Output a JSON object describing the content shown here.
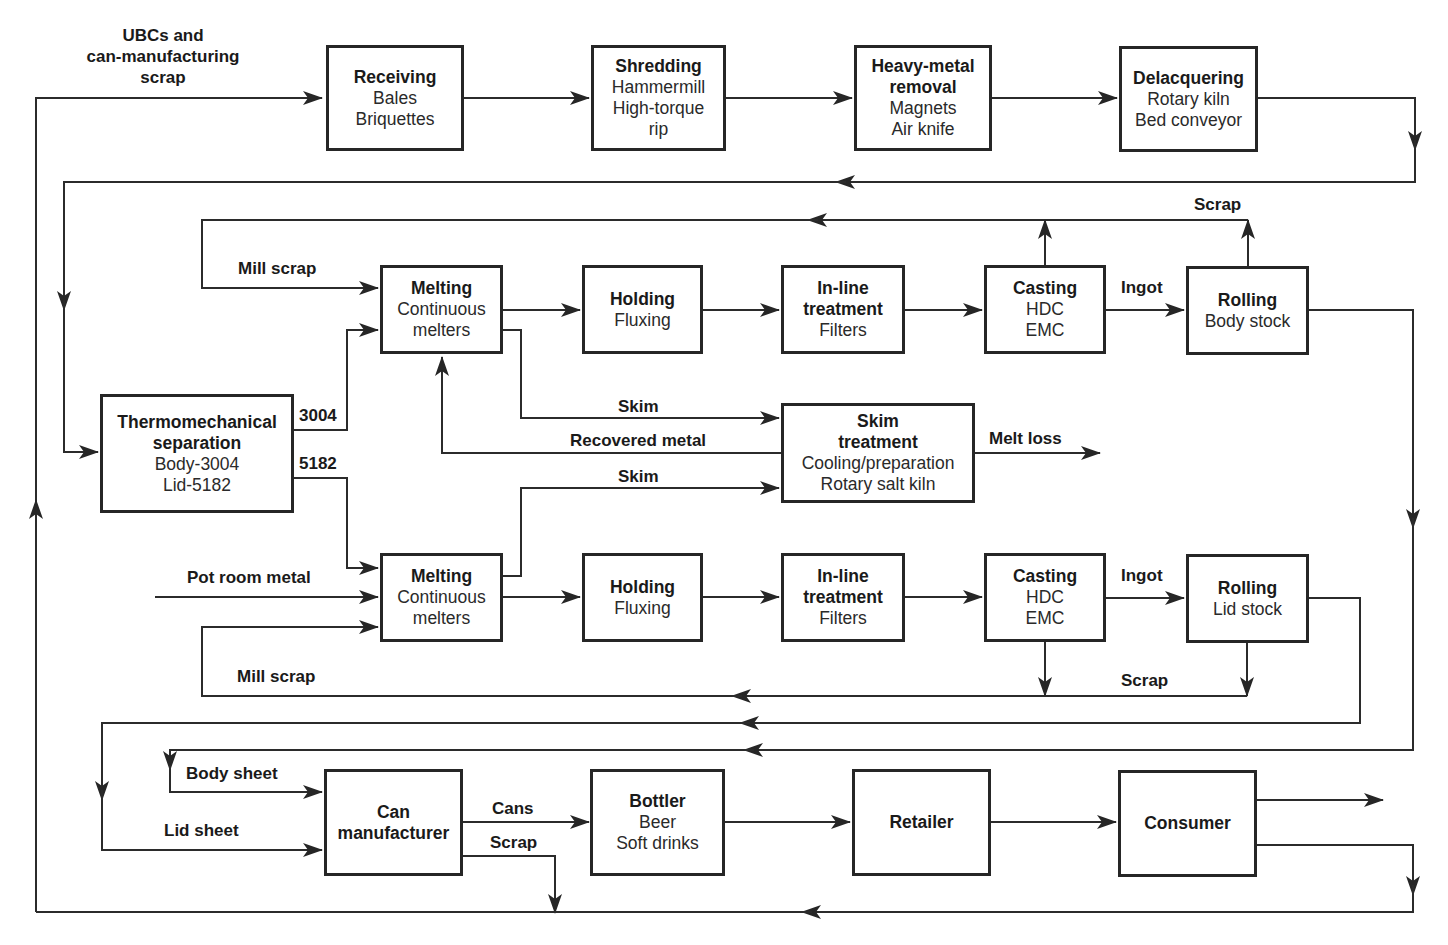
{
  "diagram": {
    "boxes": {
      "receiving": {
        "title": "Receiving",
        "lines": [
          "Bales",
          "Briquettes"
        ]
      },
      "shredding": {
        "title": "Shredding",
        "lines": [
          "Hammermill",
          "High-torque",
          "rip"
        ]
      },
      "heavy_metal": {
        "title": "Heavy-metal",
        "title2": "removal",
        "lines": [
          "Magnets",
          "Air knife"
        ]
      },
      "delacquering": {
        "title": "Delacquering",
        "lines": [
          "Rotary kiln",
          "Bed conveyor"
        ]
      },
      "thermo": {
        "title": "Thermomechanical",
        "title2": "separation",
        "lines": [
          "Body-3004",
          "Lid-5182"
        ]
      },
      "melting_body": {
        "title": "Melting",
        "lines": [
          "Continuous",
          "melters"
        ]
      },
      "holding_body": {
        "title": "Holding",
        "lines": [
          "Fluxing"
        ]
      },
      "inline_body": {
        "title": "In-line",
        "title2": "treatment",
        "lines": [
          "Filters"
        ]
      },
      "casting_body": {
        "title": "Casting",
        "lines": [
          "HDC",
          "EMC"
        ]
      },
      "rolling_body": {
        "title": "Rolling",
        "lines": [
          "Body stock"
        ]
      },
      "skim": {
        "title": "Skim",
        "title2": "treatment",
        "lines": [
          "Cooling/preparation",
          "Rotary salt kiln"
        ]
      },
      "melting_lid": {
        "title": "Melting",
        "lines": [
          "Continuous",
          "melters"
        ]
      },
      "holding_lid": {
        "title": "Holding",
        "lines": [
          "Fluxing"
        ]
      },
      "inline_lid": {
        "title": "In-line",
        "title2": "treatment",
        "lines": [
          "Filters"
        ]
      },
      "casting_lid": {
        "title": "Casting",
        "lines": [
          "HDC",
          "EMC"
        ]
      },
      "rolling_lid": {
        "title": "Rolling",
        "lines": [
          "Lid stock"
        ]
      },
      "can_mfr": {
        "title": "Can",
        "title2": "manufacturer"
      },
      "bottler": {
        "title": "Bottler",
        "lines": [
          "Beer",
          "Soft drinks"
        ]
      },
      "retailer": {
        "title": "Retailer"
      },
      "consumer": {
        "title": "Consumer"
      }
    },
    "labels": {
      "ubcs_1": "UBCs and",
      "ubcs_2": "can-manufacturing",
      "ubcs_3": "scrap",
      "scrap_top": "Scrap",
      "mill_scrap_top": "Mill scrap",
      "ingot_top": "Ingot",
      "alloy_3004": "3004",
      "alloy_5182": "5182",
      "skim_top": "Skim",
      "recovered_metal": "Recovered metal",
      "skim_bottom": "Skim",
      "melt_loss": "Melt loss",
      "pot_room_metal": "Pot room metal",
      "ingot_bottom": "Ingot",
      "mill_scrap_bottom": "Mill scrap",
      "scrap_bottom": "Scrap",
      "body_sheet": "Body sheet",
      "lid_sheet": "Lid sheet",
      "cans": "Cans",
      "scrap_can": "Scrap"
    }
  }
}
